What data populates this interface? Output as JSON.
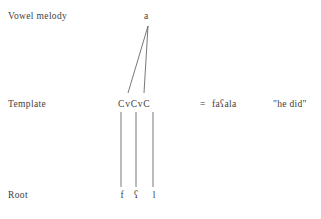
{
  "figure": {
    "type": "autosegmental-tier-diagram",
    "background_color": "#ffffff",
    "text_color": "#3d3d3d",
    "line_color": "#555555"
  },
  "tiers": {
    "vowel_melody": {
      "label": "Vowel melody",
      "segments": [
        "a"
      ]
    },
    "template": {
      "label": "Template",
      "string": "CvCvC",
      "slots": [
        "C",
        "v",
        "C",
        "v",
        "C"
      ]
    },
    "root": {
      "label": "Root",
      "segments": [
        "f",
        "ʕ",
        "l"
      ]
    }
  },
  "derivation": {
    "equals": "=",
    "surface_form": "faʕala",
    "gloss": "\"he did\""
  },
  "associations": {
    "vowel_to_template": [
      {
        "from": "a",
        "to_slot_index": 1
      },
      {
        "from": "a",
        "to_slot_index": 3
      }
    ],
    "template_to_root": [
      {
        "from_slot_index": 0,
        "to": "f"
      },
      {
        "from_slot_index": 2,
        "to": "ʕ"
      },
      {
        "from_slot_index": 4,
        "to": "l"
      }
    ]
  }
}
